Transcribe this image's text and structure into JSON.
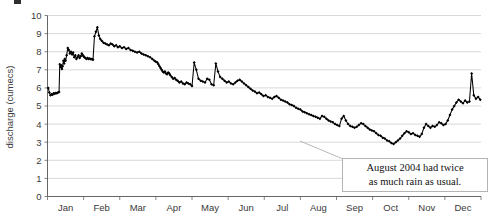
{
  "chart_data": {
    "type": "line",
    "title": "",
    "subtitle": "",
    "xlabel": "",
    "ylabel": "discharge (cumecs)",
    "ylim": [
      0,
      10
    ],
    "yticks": [
      0,
      1,
      2,
      3,
      4,
      5,
      6,
      7,
      8,
      9,
      10
    ],
    "ytick_labels": [
      "0",
      "1",
      "2",
      "3",
      "4",
      "5",
      "6",
      "7",
      "8",
      "9",
      "10"
    ],
    "categories": [
      "Jan",
      "Feb",
      "Mar",
      "Apr",
      "May",
      "Jun",
      "Jul",
      "Aug",
      "Sep",
      "Oct",
      "Nov",
      "Dec"
    ],
    "xtick_labels": [
      "Jan",
      "Feb",
      "Mar",
      "Apr",
      "May",
      "Jun",
      "Jul",
      "Aug",
      "Sep",
      "Oct",
      "Nov",
      "Dec"
    ],
    "grid": true,
    "grid_axis": "y",
    "legend": false,
    "legend_position": "none",
    "marker": "diamond",
    "line_color": "#000000",
    "marker_color": "#000000",
    "x_units": "month",
    "x_range_months": [
      0,
      12
    ],
    "series": [
      {
        "name": "discharge",
        "x": [
          0.02,
          0.05,
          0.08,
          0.11,
          0.14,
          0.17,
          0.2,
          0.23,
          0.26,
          0.29,
          0.32,
          0.34,
          0.36,
          0.38,
          0.4,
          0.42,
          0.44,
          0.46,
          0.48,
          0.5,
          0.53,
          0.56,
          0.59,
          0.62,
          0.65,
          0.68,
          0.71,
          0.74,
          0.77,
          0.8,
          0.83,
          0.86,
          0.89,
          0.92,
          0.95,
          0.98,
          1.0,
          1.02,
          1.05,
          1.08,
          1.11,
          1.14,
          1.17,
          1.2,
          1.23,
          1.26,
          1.3,
          1.34,
          1.38,
          1.42,
          1.46,
          1.5,
          1.55,
          1.6,
          1.65,
          1.7,
          1.75,
          1.8,
          1.85,
          1.9,
          1.95,
          2.0,
          2.06,
          2.12,
          2.18,
          2.24,
          2.3,
          2.36,
          2.42,
          2.48,
          2.54,
          2.6,
          2.66,
          2.72,
          2.78,
          2.84,
          2.9,
          2.96,
          3.0,
          3.04,
          3.07,
          3.1,
          3.13,
          3.16,
          3.19,
          3.22,
          3.25,
          3.28,
          3.31,
          3.34,
          3.37,
          3.4,
          3.44,
          3.48,
          3.52,
          3.56,
          3.6,
          3.65,
          3.7,
          3.75,
          3.8,
          3.85,
          3.9,
          3.95,
          4.0,
          4.06,
          4.12,
          4.18,
          4.24,
          4.3,
          4.36,
          4.42,
          4.48,
          4.54,
          4.6,
          4.66,
          4.72,
          4.78,
          4.84,
          4.9,
          4.96,
          5.02,
          5.08,
          5.14,
          5.2,
          5.26,
          5.32,
          5.38,
          5.44,
          5.5,
          5.56,
          5.62,
          5.68,
          5.74,
          5.8,
          5.86,
          5.92,
          5.98,
          6.04,
          6.1,
          6.16,
          6.22,
          6.28,
          6.34,
          6.4,
          6.46,
          6.52,
          6.58,
          6.64,
          6.7,
          6.76,
          6.82,
          6.88,
          6.94,
          7.0,
          7.06,
          7.12,
          7.18,
          7.24,
          7.3,
          7.36,
          7.42,
          7.48,
          7.54,
          7.6,
          7.66,
          7.72,
          7.78,
          7.84,
          7.9,
          7.96,
          8.02,
          8.08,
          8.14,
          8.2,
          8.26,
          8.32,
          8.38,
          8.44,
          8.5,
          8.56,
          8.62,
          8.68,
          8.74,
          8.8,
          8.86,
          8.92,
          8.98,
          9.04,
          9.1,
          9.16,
          9.22,
          9.28,
          9.34,
          9.4,
          9.46,
          9.52,
          9.58,
          9.64,
          9.7,
          9.76,
          9.82,
          9.88,
          9.94,
          10.0,
          10.06,
          10.12,
          10.18,
          10.24,
          10.3,
          10.36,
          10.42,
          10.48,
          10.54,
          10.6,
          10.66,
          10.72,
          10.78,
          10.84,
          10.9,
          10.96,
          11.02,
          11.08,
          11.14,
          11.2,
          11.26,
          11.32,
          11.38,
          11.44,
          11.5,
          11.56,
          11.62,
          11.68,
          11.74,
          11.8,
          11.86,
          11.92,
          11.98
        ],
        "values": [
          6.0,
          5.75,
          5.6,
          5.65,
          5.62,
          5.7,
          5.68,
          5.72,
          5.7,
          5.75,
          5.78,
          7.3,
          7.15,
          7.25,
          7.05,
          7.2,
          7.5,
          7.35,
          7.6,
          7.5,
          7.8,
          8.2,
          8.1,
          7.9,
          8.0,
          7.85,
          7.95,
          7.7,
          7.8,
          7.6,
          7.7,
          7.8,
          7.65,
          7.75,
          7.9,
          7.8,
          7.75,
          7.7,
          7.65,
          7.6,
          7.65,
          7.6,
          7.62,
          7.58,
          7.6,
          7.55,
          8.85,
          9.1,
          9.35,
          8.9,
          8.7,
          8.6,
          8.5,
          8.45,
          8.4,
          8.35,
          8.45,
          8.4,
          8.3,
          8.35,
          8.25,
          8.3,
          8.2,
          8.25,
          8.15,
          8.2,
          8.1,
          8.05,
          8.0,
          7.95,
          8.0,
          7.9,
          7.85,
          7.8,
          7.75,
          7.7,
          7.6,
          7.5,
          7.45,
          7.4,
          7.3,
          7.2,
          7.1,
          7.0,
          6.9,
          6.85,
          6.9,
          6.8,
          6.75,
          6.85,
          6.8,
          6.7,
          6.6,
          6.5,
          6.55,
          6.45,
          6.4,
          6.3,
          6.35,
          6.25,
          6.2,
          6.3,
          6.25,
          6.2,
          6.1,
          7.4,
          7.0,
          6.5,
          6.4,
          6.35,
          6.3,
          6.5,
          6.45,
          6.2,
          6.15,
          7.35,
          6.9,
          6.6,
          6.5,
          6.4,
          6.3,
          6.35,
          6.25,
          6.2,
          6.3,
          6.4,
          6.45,
          6.35,
          6.25,
          6.15,
          6.05,
          5.95,
          5.85,
          5.8,
          5.7,
          5.75,
          5.65,
          5.55,
          5.6,
          5.5,
          5.45,
          5.4,
          5.5,
          5.55,
          5.45,
          5.35,
          5.3,
          5.25,
          5.2,
          5.1,
          5.05,
          5.0,
          4.9,
          4.85,
          4.8,
          4.7,
          4.65,
          4.6,
          4.55,
          4.5,
          4.45,
          4.4,
          4.35,
          4.3,
          4.45,
          4.4,
          4.3,
          4.2,
          4.15,
          4.1,
          4.0,
          3.95,
          3.9,
          4.3,
          4.45,
          4.2,
          4.0,
          3.9,
          3.85,
          3.8,
          3.85,
          3.95,
          4.05,
          4.0,
          3.9,
          3.8,
          3.7,
          3.65,
          3.6,
          3.5,
          3.4,
          3.35,
          3.25,
          3.2,
          3.1,
          3.05,
          2.95,
          2.9,
          3.0,
          3.1,
          3.2,
          3.35,
          3.5,
          3.6,
          3.55,
          3.45,
          3.5,
          3.4,
          3.35,
          3.3,
          3.45,
          3.8,
          4.0,
          3.9,
          3.8,
          3.9,
          3.85,
          3.95,
          4.1,
          4.05,
          3.95,
          4.0,
          4.2,
          4.5,
          4.8,
          5.0,
          5.2,
          5.35,
          5.25,
          5.15,
          5.3,
          5.2,
          5.25,
          6.8,
          5.6,
          5.4,
          5.5,
          5.35
        ]
      }
    ],
    "annotations": [
      {
        "name": "august-2004-callout",
        "text_lines": [
          "August 2004 had twice",
          "as much rain as usual."
        ],
        "points_to_x": 7.3,
        "points_to_y": 3.2
      }
    ]
  },
  "axis": {
    "y_title": "discharge (cumecs)"
  },
  "callout": {
    "line1": "August 2004 had twice",
    "line2": "as much rain as usual."
  }
}
